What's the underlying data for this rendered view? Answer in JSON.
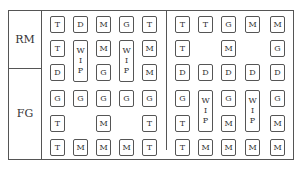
{
  "rows": {
    "rm": "RM",
    "fg": "FG"
  },
  "cells": [
    {
      "t": "T",
      "x": 50,
      "y": 16
    },
    {
      "t": "D",
      "x": 73,
      "y": 16
    },
    {
      "t": "M",
      "x": 96,
      "y": 16
    },
    {
      "t": "G",
      "x": 119,
      "y": 16
    },
    {
      "t": "T",
      "x": 142,
      "y": 16
    },
    {
      "t": "T",
      "x": 175,
      "y": 16
    },
    {
      "t": "T",
      "x": 198,
      "y": 16
    },
    {
      "t": "G",
      "x": 221,
      "y": 16
    },
    {
      "t": "M",
      "x": 245,
      "y": 16
    },
    {
      "t": "M",
      "x": 270,
      "y": 16
    },
    {
      "t": "T",
      "x": 50,
      "y": 40
    },
    {
      "t": "M",
      "x": 96,
      "y": 40
    },
    {
      "t": "M",
      "x": 142,
      "y": 40
    },
    {
      "t": "T",
      "x": 175,
      "y": 40
    },
    {
      "t": "M",
      "x": 221,
      "y": 40
    },
    {
      "t": "G",
      "x": 270,
      "y": 40
    },
    {
      "t": "D",
      "x": 50,
      "y": 64
    },
    {
      "t": "G",
      "x": 96,
      "y": 64
    },
    {
      "t": "M",
      "x": 142,
      "y": 64
    },
    {
      "t": "D",
      "x": 175,
      "y": 64
    },
    {
      "t": "D",
      "x": 198,
      "y": 64
    },
    {
      "t": "D",
      "x": 221,
      "y": 64
    },
    {
      "t": "D",
      "x": 245,
      "y": 64
    },
    {
      "t": "D",
      "x": 270,
      "y": 64
    },
    {
      "t": "G",
      "x": 50,
      "y": 90
    },
    {
      "t": "G",
      "x": 73,
      "y": 90
    },
    {
      "t": "G",
      "x": 96,
      "y": 90
    },
    {
      "t": "G",
      "x": 119,
      "y": 90
    },
    {
      "t": "G",
      "x": 142,
      "y": 90
    },
    {
      "t": "G",
      "x": 175,
      "y": 90
    },
    {
      "t": "G",
      "x": 221,
      "y": 90
    },
    {
      "t": "G",
      "x": 270,
      "y": 90
    },
    {
      "t": "T",
      "x": 50,
      "y": 115
    },
    {
      "t": "M",
      "x": 96,
      "y": 115
    },
    {
      "t": "T",
      "x": 142,
      "y": 115
    },
    {
      "t": "T",
      "x": 175,
      "y": 115
    },
    {
      "t": "M",
      "x": 221,
      "y": 115
    },
    {
      "t": "M",
      "x": 270,
      "y": 115
    },
    {
      "t": "T",
      "x": 50,
      "y": 139
    },
    {
      "t": "M",
      "x": 73,
      "y": 139
    },
    {
      "t": "M",
      "x": 96,
      "y": 139
    },
    {
      "t": "M",
      "x": 119,
      "y": 139
    },
    {
      "t": "T",
      "x": 142,
      "y": 139
    },
    {
      "t": "T",
      "x": 175,
      "y": 139
    },
    {
      "t": "M",
      "x": 198,
      "y": 139
    },
    {
      "t": "M",
      "x": 221,
      "y": 139
    },
    {
      "t": "M",
      "x": 245,
      "y": 139
    },
    {
      "t": "M",
      "x": 270,
      "y": 139
    }
  ],
  "wips": [
    {
      "x": 73,
      "y": 40,
      "l": [
        "W",
        "I",
        "P"
      ]
    },
    {
      "x": 119,
      "y": 40,
      "l": [
        "W",
        "I",
        "P"
      ]
    },
    {
      "x": 198,
      "y": 90,
      "l": [
        "W",
        "I",
        "P"
      ]
    },
    {
      "x": 245,
      "y": 90,
      "l": [
        "W",
        "I",
        "P"
      ]
    }
  ]
}
